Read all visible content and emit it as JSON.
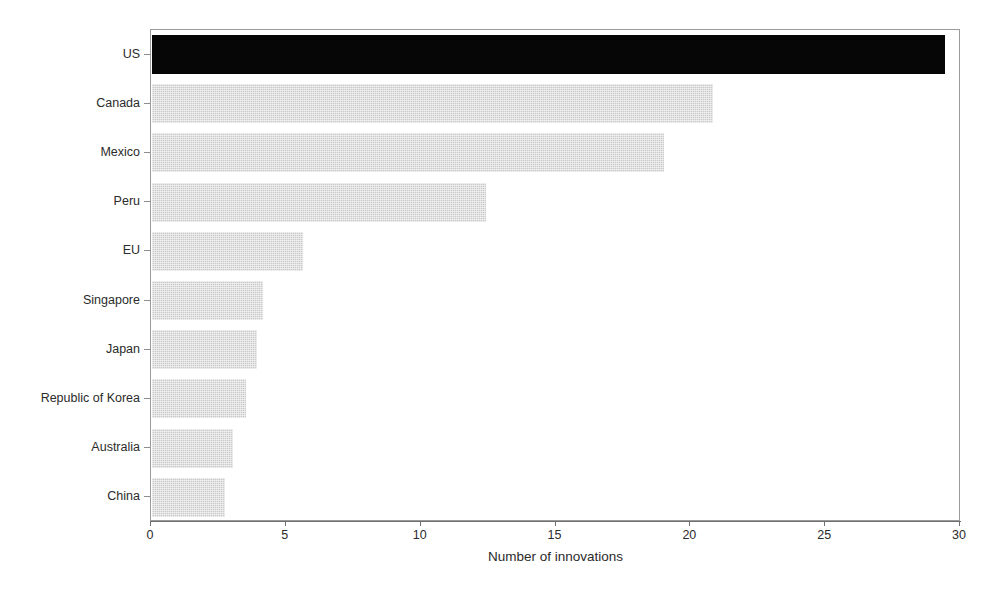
{
  "chart_data": {
    "type": "bar",
    "orientation": "horizontal",
    "title": "",
    "subtitle": "",
    "xlabel": "Number of innovations",
    "ylabel": "",
    "xlim": [
      0,
      30
    ],
    "xticks": [
      0,
      5,
      10,
      15,
      20,
      25,
      30
    ],
    "xtick_labels": [
      "0",
      "5",
      "10",
      "15",
      "20",
      "25",
      "30"
    ],
    "grid": false,
    "legend": null,
    "categories": [
      "US",
      "Canada",
      "Mexico",
      "Peru",
      "EU",
      "Singapore",
      "Japan",
      "Republic of Korea",
      "Australia",
      "China"
    ],
    "values": [
      29.4,
      20.8,
      19.0,
      12.4,
      5.6,
      4.1,
      3.9,
      3.5,
      3.0,
      2.7
    ],
    "bar_colors": [
      "#060606",
      "#c9c9c9",
      "#c9c9c9",
      "#c9c9c9",
      "#c9c9c9",
      "#c9c9c9",
      "#c9c9c9",
      "#c9c9c9",
      "#c9c9c9",
      "#c9c9c9"
    ],
    "highlight_category": "US",
    "axis_color": "#6f6f6f",
    "text_color": "#2b2b2b"
  }
}
